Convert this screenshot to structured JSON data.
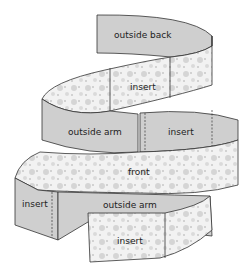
{
  "diagram": {
    "type": "spiral sewing band layout",
    "labels": {
      "outside_back": "outside back",
      "insert_1": "insert",
      "outside_arm_1": "outside arm",
      "insert_2": "insert",
      "front": "front",
      "insert_3": "insert",
      "outside_arm_2": "outside arm",
      "insert_4": "insert"
    },
    "colors": {
      "grey_panel": "#cfcfcf",
      "dotted_panel": "#f2f2f2",
      "dot": "#bdbdbd",
      "outline": "#333333"
    }
  }
}
